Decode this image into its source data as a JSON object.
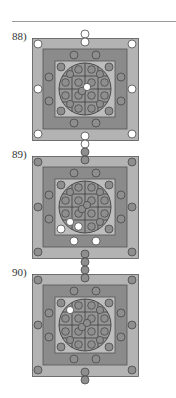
{
  "colors": {
    "outer_band": "#b3b3b3",
    "middle_band": "#8b8b8b",
    "inner_band": "#bdbdbd",
    "disc": "#969696",
    "grid_line": "#3e3e3e",
    "border": "#555555",
    "circle_gray": "#8e8e8e",
    "circle_white": "#ffffff",
    "circle_stroke": "#4a4a4a"
  },
  "figures": [
    {
      "label": "88)",
      "top": 30,
      "white": [
        "outer_tl",
        "outer_tr",
        "outer_bl",
        "outer_br",
        "outer_ml",
        "outer_mr",
        "outer_top1",
        "outer_top2",
        "outer_bot1",
        "outer_bot2",
        "center_a"
      ]
    },
    {
      "label": "89)",
      "top": 148,
      "white": [
        "mid_b1",
        "mid_b2",
        "inner_bl",
        "grid_30",
        "grid_31"
      ]
    },
    {
      "label": "90)",
      "top": 266,
      "white": [
        "grid_00"
      ]
    }
  ]
}
